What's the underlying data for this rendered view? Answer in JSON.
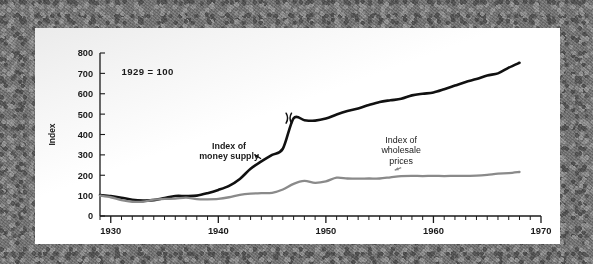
{
  "figure": {
    "card_note": "1929 = 100"
  },
  "chart_data": {
    "type": "line",
    "title": "",
    "subtitle": "",
    "note": "1929 = 100",
    "xlabel": "",
    "ylabel": "Index",
    "xlim": [
      1929,
      1970
    ],
    "ylim": [
      0,
      800
    ],
    "ytick_values": [
      0,
      100,
      200,
      300,
      400,
      500,
      600,
      700,
      800
    ],
    "ytick_labels": [
      "0",
      "100",
      "200",
      "300",
      "400",
      "500",
      "600",
      "700",
      "800"
    ],
    "xtick_major_values": [
      1930,
      1940,
      1950,
      1960,
      1970
    ],
    "xtick_major_labels": [
      "1930",
      "1940",
      "1950",
      "1960",
      "1970"
    ],
    "xtick_minor_step": 1,
    "grid": false,
    "legend": "annotations-on-curve",
    "annotations": [
      {
        "name": "money-supply-label",
        "text_lines": [
          "Index of",
          "money supply"
        ],
        "color": "#111111",
        "x": 1941.0,
        "y": 330,
        "arrow_to": {
          "x": 1943.4,
          "y": 300
        }
      },
      {
        "name": "wholesale-prices-label",
        "text_lines": [
          "Index of",
          "wholesale",
          "prices"
        ],
        "color": "#8a8a8a",
        "x": 1957.0,
        "y": 360,
        "arrow_to": {
          "x": 1956.4,
          "y": 225
        }
      }
    ],
    "break_marks": [
      {
        "series": "Index of money supply",
        "x": 1946.6,
        "y": 480
      }
    ],
    "series": [
      {
        "name": "Index of money supply",
        "color": "#111111",
        "width": 2.6,
        "x": [
          1929,
          1930,
          1931,
          1932,
          1933,
          1934,
          1935,
          1936,
          1937,
          1938,
          1939,
          1940,
          1941,
          1942,
          1943,
          1944,
          1945,
          1946,
          1947,
          1948,
          1949,
          1950,
          1951,
          1952,
          1953,
          1954,
          1955,
          1956,
          1957,
          1958,
          1959,
          1960,
          1961,
          1962,
          1963,
          1964,
          1965,
          1966,
          1967,
          1968
        ],
        "values": [
          103,
          98,
          90,
          80,
          76,
          78,
          88,
          98,
          98,
          100,
          112,
          128,
          148,
          182,
          232,
          268,
          300,
          330,
          480,
          470,
          468,
          478,
          498,
          515,
          528,
          545,
          560,
          568,
          575,
          592,
          600,
          606,
          622,
          640,
          658,
          672,
          690,
          700,
          728,
          752
        ]
      },
      {
        "name": "Index of wholesale prices",
        "color": "#8a8a8a",
        "width": 2.3,
        "x": [
          1929,
          1930,
          1931,
          1932,
          1933,
          1934,
          1935,
          1936,
          1937,
          1938,
          1939,
          1940,
          1941,
          1942,
          1943,
          1944,
          1945,
          1946,
          1947,
          1948,
          1949,
          1950,
          1951,
          1952,
          1953,
          1954,
          1955,
          1956,
          1957,
          1958,
          1959,
          1960,
          1961,
          1962,
          1963,
          1964,
          1965,
          1966,
          1967,
          1968
        ],
        "values": [
          100,
          92,
          78,
          70,
          70,
          80,
          84,
          85,
          90,
          83,
          82,
          84,
          92,
          104,
          110,
          112,
          114,
          130,
          158,
          172,
          163,
          170,
          188,
          184,
          183,
          184,
          184,
          190,
          196,
          197,
          196,
          197,
          196,
          197,
          197,
          198,
          202,
          208,
          210,
          216
        ]
      }
    ]
  }
}
